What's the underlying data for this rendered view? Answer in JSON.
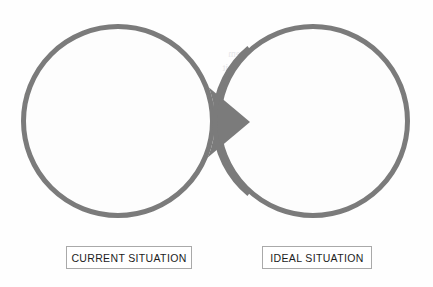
{
  "diagram": {
    "type": "two-circle-transition",
    "title": "",
    "stroke_color": "#7b7b7b",
    "arrow_color": "#7b7b7b",
    "circle_fill": "#fdfdfd",
    "background": "#ffffff",
    "nodes": [
      {
        "id": "current",
        "shape": "circle",
        "label": "CURRENT SITUATION",
        "cx": 118,
        "cy": 121,
        "r": 97
      },
      {
        "id": "ideal",
        "shape": "circle",
        "label": "IDEAL SITUATION",
        "cx": 313,
        "cy": 121,
        "r": 97
      }
    ],
    "connector": {
      "id": "transition-arrow",
      "shape": "triangle",
      "direction": "right",
      "from": "current",
      "to": "ideal",
      "apex_x": 250,
      "apex_y": 122,
      "base_top_y": 72,
      "base_bottom_y": 172
    }
  },
  "labels": {
    "current": "CURRENT SITUATION",
    "ideal": "IDEAL SITUATION"
  },
  "artifacts": {
    "bleed_left": "in sit a simili\nsequere e  colitur\nita si  su  re torma\nsint quos el  equi uae\ntir  to  e sintite  e sa\nsint  sin  si  i  e  ii  i\nsumus esse  libero  a\nsequ  mod  blan  nos\n       e  solore",
    "bleed_right": "utem apiae, si tem\nmo  e  e  e  tu  e  sit\ne  o  tur  bus  i  tas\nenis  quodis  omni  a\nsas  porisciam  tur\nil  iuscio conem  cus\nmilliq  uiasperspiet\nne  catem  ut  es  o\n      e  tae"
  }
}
